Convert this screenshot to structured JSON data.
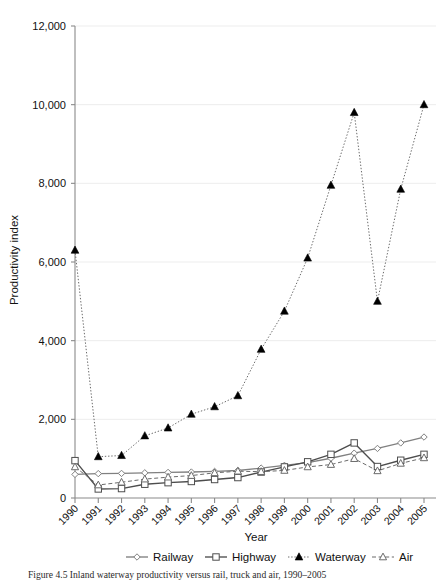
{
  "figure": {
    "caption": "Figure 4.5 Inland waterway productivity versus rail, truck and air, 1990–2005"
  },
  "chart_data": {
    "type": "line",
    "title": "",
    "xlabel": "Year",
    "ylabel": "Productivity index",
    "categories": [
      "1990",
      "1991",
      "1992",
      "1993",
      "1994",
      "1995",
      "1996",
      "1997",
      "1998",
      "1999",
      "2000",
      "2001",
      "2002",
      "2003",
      "2004",
      "2005"
    ],
    "x": [
      1990,
      1991,
      1992,
      1993,
      1994,
      1995,
      1996,
      1997,
      1998,
      1999,
      2000,
      2001,
      2002,
      2003,
      2004,
      2005
    ],
    "xlim": [
      1990,
      2005
    ],
    "ylim": [
      0,
      12000
    ],
    "y_ticks": [
      0,
      2000,
      4000,
      6000,
      8000,
      10000,
      12000
    ],
    "y_tick_labels": [
      "0",
      "2,000",
      "4,000",
      "6,000",
      "8,000",
      "10,000",
      "12,000"
    ],
    "grid": "horizontal",
    "legend_position": "bottom",
    "series": [
      {
        "name": "Railway",
        "marker": "open-diamond",
        "line_style": "solid",
        "color": "#808080",
        "values": [
          600,
          620,
          625,
          640,
          650,
          660,
          675,
          700,
          760,
          830,
          900,
          1010,
          1140,
          1260,
          1400,
          1550
        ]
      },
      {
        "name": "Highway",
        "marker": "open-square",
        "line_style": "solid",
        "color": "#4d4d4d",
        "values": [
          950,
          230,
          240,
          350,
          390,
          420,
          470,
          520,
          660,
          790,
          920,
          1110,
          1400,
          800,
          960,
          1110
        ]
      },
      {
        "name": "Waterway",
        "marker": "filled-triangle",
        "line_style": "dotted",
        "color": "#6b6b6b",
        "values": [
          6300,
          1050,
          1080,
          1580,
          1780,
          2130,
          2320,
          2600,
          3780,
          4750,
          6100,
          7950,
          9800,
          5000,
          7850,
          10000
        ]
      },
      {
        "name": "Air",
        "marker": "open-triangle",
        "line_style": "dashed",
        "color": "#6b6b6b",
        "values": [
          790,
          330,
          400,
          480,
          530,
          570,
          640,
          680,
          670,
          700,
          790,
          850,
          1000,
          690,
          880,
          1020
        ]
      }
    ]
  },
  "axes": {
    "y_axis_label": "Productivity index",
    "x_axis_label": "Year"
  },
  "legend": {
    "items": [
      {
        "label": "Railway",
        "marker": "open-diamond",
        "line_style": "solid"
      },
      {
        "label": "Highway",
        "marker": "open-square",
        "line_style": "solid"
      },
      {
        "label": "Waterway",
        "marker": "filled-triangle",
        "line_style": "dotted"
      },
      {
        "label": "Air",
        "marker": "open-triangle",
        "line_style": "dashed"
      }
    ]
  },
  "style": {
    "axis_color": "#8a8a8a",
    "grid_color": "#ededed",
    "text_color": "#111111",
    "background": "#ffffff"
  }
}
